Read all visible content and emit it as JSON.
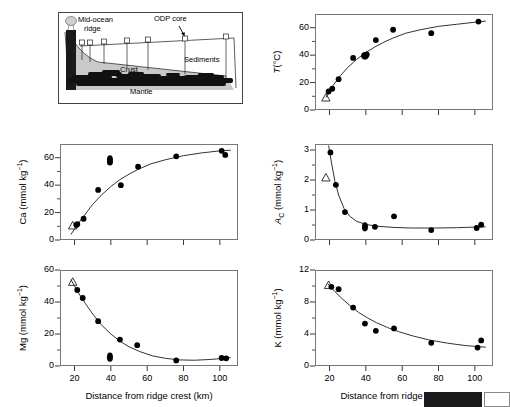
{
  "figure": {
    "schematic": {
      "labels": [
        {
          "name": "mid-ocean-ridge",
          "text": "Mid-ocean",
          "x": 20,
          "y": 4
        },
        {
          "name": "mid-ocean-ridge-2",
          "text": "ridge",
          "x": 26,
          "y": 13
        },
        {
          "name": "odp-core",
          "text": "ODP core",
          "x": 104,
          "y": 4
        },
        {
          "name": "sediments",
          "text": "Sediments",
          "x": 126,
          "y": 47
        },
        {
          "name": "crust",
          "text": "Crust",
          "x": 68,
          "y": 59
        },
        {
          "name": "mantle",
          "text": "Mantle",
          "x": 74,
          "y": 79
        }
      ],
      "core_count": 7
    },
    "xlabel": "Distance from ridge crest (km)",
    "xticks": [
      20,
      40,
      60,
      80,
      100
    ],
    "xlim": [
      12,
      110
    ]
  },
  "chart_data": [
    {
      "id": "temperature",
      "type": "scatter",
      "title": "",
      "ylabel_html": "<span class=\"ital\">T</span>(°C)",
      "ylabel_plain": "T (degC)",
      "xlabel": "",
      "xlim": [
        12,
        110
      ],
      "ylim": [
        0,
        70
      ],
      "yticks": [
        0,
        20,
        40,
        60
      ],
      "yminor": [
        10,
        30,
        50
      ],
      "xticks_labeled": false,
      "grid": false,
      "points": [
        {
          "x": 19.5,
          "y": 13.5,
          "marker": "filled"
        },
        {
          "x": 21.5,
          "y": 15.5,
          "marker": "filled"
        },
        {
          "x": 25.0,
          "y": 22.5,
          "marker": "filled"
        },
        {
          "x": 33.0,
          "y": 38.0,
          "marker": "filled"
        },
        {
          "x": 39.5,
          "y": 39.5,
          "marker": "filled-large"
        },
        {
          "x": 40.5,
          "y": 40.5,
          "marker": "filled"
        },
        {
          "x": 45.5,
          "y": 51.0,
          "marker": "filled"
        },
        {
          "x": 55.0,
          "y": 58.5,
          "marker": "filled"
        },
        {
          "x": 76.0,
          "y": 56.0,
          "marker": "filled"
        },
        {
          "x": 102.0,
          "y": 64.5,
          "marker": "filled"
        }
      ],
      "reference_point": {
        "x": 18.0,
        "y": 9.0,
        "marker": "open-triangle"
      },
      "fit_curve": [
        {
          "x": 18,
          "y": 9
        },
        {
          "x": 22,
          "y": 18
        },
        {
          "x": 26,
          "y": 25
        },
        {
          "x": 30,
          "y": 31
        },
        {
          "x": 35,
          "y": 37
        },
        {
          "x": 40,
          "y": 42
        },
        {
          "x": 45,
          "y": 46
        },
        {
          "x": 50,
          "y": 49.5
        },
        {
          "x": 55,
          "y": 52.5
        },
        {
          "x": 62,
          "y": 56
        },
        {
          "x": 70,
          "y": 58.5
        },
        {
          "x": 80,
          "y": 61
        },
        {
          "x": 90,
          "y": 62.5
        },
        {
          "x": 100,
          "y": 64
        },
        {
          "x": 106,
          "y": 64.8
        }
      ]
    },
    {
      "id": "calcium",
      "type": "scatter",
      "ylabel_html": "Ca (mmol kg<span class=\"sup\">−1</span>)",
      "ylabel_plain": "Ca (mmol kg-1)",
      "xlabel": "",
      "xlim": [
        12,
        110
      ],
      "ylim": [
        0,
        70
      ],
      "yticks": [
        0,
        20,
        40,
        60
      ],
      "yminor": [
        10,
        30,
        50
      ],
      "xticks_labeled": false,
      "grid": false,
      "points": [
        {
          "x": 21.0,
          "y": 11.0,
          "marker": "filled"
        },
        {
          "x": 21.5,
          "y": 11.5,
          "marker": "filled"
        },
        {
          "x": 25.0,
          "y": 15.5,
          "marker": "filled"
        },
        {
          "x": 33.0,
          "y": 36.5,
          "marker": "filled"
        },
        {
          "x": 39.5,
          "y": 58.5,
          "marker": "filled-tall"
        },
        {
          "x": 39.5,
          "y": 56.5,
          "marker": "filled"
        },
        {
          "x": 45.5,
          "y": 40.0,
          "marker": "filled"
        },
        {
          "x": 55.0,
          "y": 53.5,
          "marker": "filled"
        },
        {
          "x": 76.0,
          "y": 61.0,
          "marker": "filled"
        },
        {
          "x": 101.0,
          "y": 65.0,
          "marker": "filled"
        },
        {
          "x": 103.0,
          "y": 62.0,
          "marker": "filled"
        }
      ],
      "reference_point": {
        "x": 19.0,
        "y": 10.5,
        "marker": "open-triangle"
      },
      "fit_curve": [
        {
          "x": 18,
          "y": 4
        },
        {
          "x": 22,
          "y": 12
        },
        {
          "x": 26,
          "y": 19
        },
        {
          "x": 30,
          "y": 26
        },
        {
          "x": 35,
          "y": 33
        },
        {
          "x": 40,
          "y": 39
        },
        {
          "x": 45,
          "y": 44
        },
        {
          "x": 50,
          "y": 48
        },
        {
          "x": 55,
          "y": 51.5
        },
        {
          "x": 62,
          "y": 55.5
        },
        {
          "x": 70,
          "y": 58.5
        },
        {
          "x": 80,
          "y": 61.5
        },
        {
          "x": 90,
          "y": 63.5
        },
        {
          "x": 100,
          "y": 65
        },
        {
          "x": 106,
          "y": 65.5
        }
      ]
    },
    {
      "id": "alkalinity",
      "type": "scatter",
      "ylabel_html": "<span class=\"ital\">A</span><span class=\"sub\">C</span> (mmol kg<span class=\"sup\">−1</span>)",
      "ylabel_plain": "A_C (mmol kg-1)",
      "xlabel": "",
      "xlim": [
        12,
        110
      ],
      "ylim": [
        0,
        3.2
      ],
      "yticks": [
        0,
        1,
        2,
        3
      ],
      "yminor": [
        0.5,
        1.5,
        2.5
      ],
      "xticks_labeled": false,
      "grid": false,
      "points": [
        {
          "x": 20.5,
          "y": 2.92,
          "marker": "filled"
        },
        {
          "x": 23.5,
          "y": 1.84,
          "marker": "filled"
        },
        {
          "x": 28.5,
          "y": 0.93,
          "marker": "filled"
        },
        {
          "x": 39.5,
          "y": 0.44,
          "marker": "filled-tall"
        },
        {
          "x": 45.0,
          "y": 0.44,
          "marker": "filled"
        },
        {
          "x": 55.5,
          "y": 0.79,
          "marker": "filled"
        },
        {
          "x": 76.0,
          "y": 0.33,
          "marker": "filled"
        },
        {
          "x": 101.0,
          "y": 0.4,
          "marker": "filled"
        },
        {
          "x": 103.5,
          "y": 0.51,
          "marker": "filled"
        }
      ],
      "reference_point": {
        "x": 18.0,
        "y": 2.08,
        "marker": "open-triangle"
      },
      "fit_curve": [
        {
          "x": 19.5,
          "y": 3.15
        },
        {
          "x": 21,
          "y": 2.6
        },
        {
          "x": 23,
          "y": 1.95
        },
        {
          "x": 25,
          "y": 1.5
        },
        {
          "x": 28,
          "y": 1.05
        },
        {
          "x": 31,
          "y": 0.8
        },
        {
          "x": 35,
          "y": 0.62
        },
        {
          "x": 40,
          "y": 0.52
        },
        {
          "x": 46,
          "y": 0.46
        },
        {
          "x": 55,
          "y": 0.42
        },
        {
          "x": 65,
          "y": 0.4
        },
        {
          "x": 78,
          "y": 0.4
        },
        {
          "x": 90,
          "y": 0.41
        },
        {
          "x": 100,
          "y": 0.43
        },
        {
          "x": 106,
          "y": 0.44
        }
      ]
    },
    {
      "id": "magnesium",
      "type": "scatter",
      "ylabel_html": "Mg (mmol kg<span class=\"sup\">−1</span>)",
      "ylabel_plain": "Mg (mmol kg-1)",
      "xlabel": "Distance from ridge crest (km)",
      "xlim": [
        12,
        110
      ],
      "ylim": [
        0,
        60
      ],
      "yticks": [
        0,
        20,
        40,
        60
      ],
      "yminor": [
        10,
        30,
        50
      ],
      "xticks_labeled": true,
      "grid": false,
      "points": [
        {
          "x": 21.5,
          "y": 47.5,
          "marker": "filled"
        },
        {
          "x": 24.5,
          "y": 42.5,
          "marker": "filled"
        },
        {
          "x": 33.0,
          "y": 28.0,
          "marker": "filled"
        },
        {
          "x": 39.5,
          "y": 5.5,
          "marker": "filled-tall"
        },
        {
          "x": 45.0,
          "y": 16.5,
          "marker": "filled"
        },
        {
          "x": 54.5,
          "y": 13.0,
          "marker": "filled"
        },
        {
          "x": 76.0,
          "y": 3.5,
          "marker": "filled"
        },
        {
          "x": 101.0,
          "y": 5.0,
          "marker": "filled"
        },
        {
          "x": 103.5,
          "y": 4.8,
          "marker": "filled"
        }
      ],
      "reference_point": {
        "x": 19.0,
        "y": 52.5,
        "marker": "open-triangle"
      },
      "fit_curve": [
        {
          "x": 18,
          "y": 54
        },
        {
          "x": 22,
          "y": 46
        },
        {
          "x": 26,
          "y": 39
        },
        {
          "x": 30,
          "y": 32.5
        },
        {
          "x": 35,
          "y": 25.5
        },
        {
          "x": 40,
          "y": 20
        },
        {
          "x": 45,
          "y": 15.5
        },
        {
          "x": 50,
          "y": 12
        },
        {
          "x": 56,
          "y": 9
        },
        {
          "x": 63,
          "y": 6.3
        },
        {
          "x": 70,
          "y": 4.8
        },
        {
          "x": 78,
          "y": 3.8
        },
        {
          "x": 86,
          "y": 3.6
        },
        {
          "x": 95,
          "y": 4.1
        },
        {
          "x": 106,
          "y": 5.2
        }
      ]
    },
    {
      "id": "potassium",
      "type": "scatter",
      "ylabel_html": "K (mmol kg<span class=\"sup\">−1</span>)",
      "ylabel_plain": "K (mmol kg-1)",
      "xlabel": "Distance from ridge crest (km)",
      "xlim": [
        12,
        110
      ],
      "ylim": [
        0,
        12
      ],
      "yticks": [
        0,
        4,
        8,
        12
      ],
      "yminor": [
        2,
        6,
        10
      ],
      "xticks_labeled": true,
      "grid": false,
      "points": [
        {
          "x": 21.0,
          "y": 9.9,
          "marker": "filled"
        },
        {
          "x": 25.0,
          "y": 9.6,
          "marker": "filled"
        },
        {
          "x": 33.0,
          "y": 7.3,
          "marker": "filled"
        },
        {
          "x": 39.5,
          "y": 5.3,
          "marker": "filled"
        },
        {
          "x": 45.5,
          "y": 4.4,
          "marker": "filled"
        },
        {
          "x": 55.5,
          "y": 4.7,
          "marker": "filled"
        },
        {
          "x": 76.0,
          "y": 2.9,
          "marker": "filled"
        },
        {
          "x": 101.5,
          "y": 2.3,
          "marker": "filled"
        },
        {
          "x": 103.5,
          "y": 3.2,
          "marker": "filled"
        }
      ],
      "reference_point": {
        "x": 19.5,
        "y": 10.1,
        "marker": "open-triangle"
      },
      "fit_curve": [
        {
          "x": 19,
          "y": 10.3
        },
        {
          "x": 23,
          "y": 9.3
        },
        {
          "x": 27,
          "y": 8.4
        },
        {
          "x": 31,
          "y": 7.6
        },
        {
          "x": 36,
          "y": 6.7
        },
        {
          "x": 41,
          "y": 6.0
        },
        {
          "x": 46,
          "y": 5.4
        },
        {
          "x": 52,
          "y": 4.8
        },
        {
          "x": 58,
          "y": 4.3
        },
        {
          "x": 66,
          "y": 3.75
        },
        {
          "x": 75,
          "y": 3.25
        },
        {
          "x": 85,
          "y": 2.85
        },
        {
          "x": 95,
          "y": 2.55
        },
        {
          "x": 106,
          "y": 2.35
        }
      ]
    }
  ]
}
